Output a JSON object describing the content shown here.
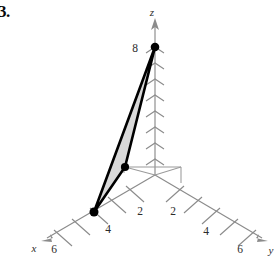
{
  "figure": {
    "problem_number": "3.",
    "axes": {
      "z": {
        "label": "z",
        "ticks": [
          2,
          4,
          6,
          8
        ],
        "labeled_ticks": [
          {
            "value": "8"
          }
        ]
      },
      "x": {
        "label": "x",
        "labeled_ticks": [
          "4",
          "6"
        ]
      },
      "y": {
        "label": "y",
        "labeled_ticks": [
          "2",
          "4",
          "6"
        ]
      },
      "y_near": {
        "labeled_ticks": [
          "2"
        ]
      }
    },
    "labels": {
      "z_axis": "z",
      "x_axis": "x",
      "y_axis": "y",
      "z_eight": "8",
      "x_four": "4",
      "x_six": "6",
      "xy_two": "2",
      "y_two": "2",
      "y_four": "4",
      "y_six": "6"
    },
    "colors": {
      "axis": "#8b8b8b",
      "triangle_fill": "#d9d9d9",
      "triangle_edge": "#000000",
      "text": "#2b2b2b",
      "background": "#ffffff"
    },
    "triangle": {
      "name": "shaded-triangle",
      "vertices": [
        {
          "name": "vertex-z8",
          "screen": [
            155,
            47
          ]
        },
        {
          "name": "vertex-mid",
          "screen": [
            125,
            167
          ]
        },
        {
          "name": "vertex-x",
          "screen": [
            94,
            212
          ]
        }
      ]
    }
  }
}
